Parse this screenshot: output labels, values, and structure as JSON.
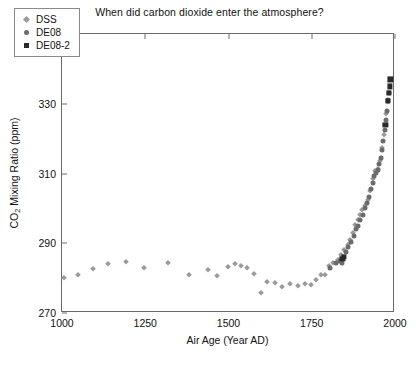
{
  "chart_data": {
    "type": "scatter",
    "title": "When did carbon dioxide enter the atmosphere?",
    "xlabel": "Air Age (Year AD)",
    "ylabel_html": "CO<sub>2</sub> Mixing Ratio (ppm)",
    "ylabel_text": "CO2 Mixing Ratio (ppm)",
    "xlim": [
      1000,
      2000
    ],
    "ylim": [
      270,
      350
    ],
    "xticks": [
      1000,
      1250,
      1500,
      1750,
      2000
    ],
    "yticks": [
      270,
      290,
      310,
      330,
      350
    ],
    "grid": false,
    "legend_position": "top-left",
    "colors": {
      "DSS": "#9a9a9a",
      "DE08": "#6b6b6b",
      "DE08-2": "#2a2a2a",
      "axis": "#6a6a6a",
      "text": "#111111",
      "background": "#ffffff"
    },
    "series": [
      {
        "name": "DSS",
        "marker": "diamond",
        "color": "#9a9a9a",
        "points": [
          [
            1006,
            280.0
          ],
          [
            1048,
            280.8
          ],
          [
            1092,
            282.5
          ],
          [
            1137,
            284.0
          ],
          [
            1191,
            284.6
          ],
          [
            1246,
            282.8
          ],
          [
            1317,
            284.2
          ],
          [
            1380,
            281.0
          ],
          [
            1437,
            282.4
          ],
          [
            1464,
            280.6
          ],
          [
            1497,
            283.2
          ],
          [
            1520,
            284.0
          ],
          [
            1538,
            283.6
          ],
          [
            1556,
            283.0
          ],
          [
            1578,
            281.2
          ],
          [
            1598,
            275.6
          ],
          [
            1616,
            279.0
          ],
          [
            1641,
            278.6
          ],
          [
            1662,
            277.4
          ],
          [
            1686,
            278.2
          ],
          [
            1710,
            277.6
          ],
          [
            1729,
            278.4
          ],
          [
            1748,
            278.0
          ],
          [
            1762,
            279.4
          ],
          [
            1777,
            280.8
          ],
          [
            1789,
            281.0
          ],
          [
            1802,
            283.6
          ],
          [
            1815,
            284.4
          ],
          [
            1828,
            285.2
          ],
          [
            1838,
            286.6
          ],
          [
            1848,
            288.0
          ],
          [
            1858,
            289.4
          ],
          [
            1866,
            291.0
          ],
          [
            1874,
            293.0
          ],
          [
            1881,
            295.2
          ],
          [
            1888,
            296.8
          ],
          [
            1895,
            298.0
          ],
          [
            1902,
            299.4
          ],
          [
            1910,
            300.6
          ],
          [
            1918,
            302.4
          ],
          [
            1926,
            305.0
          ],
          [
            1934,
            308.4
          ],
          [
            1941,
            310.6
          ],
          [
            1948,
            311.4
          ],
          [
            1955,
            313.6
          ],
          [
            1962,
            317.4
          ],
          [
            1968,
            321.0
          ],
          [
            1974,
            327.0
          ],
          [
            1978,
            330.6
          ]
        ]
      },
      {
        "name": "DE08",
        "marker": "circle",
        "color": "#6b6b6b",
        "points": [
          [
            1806,
            283.0
          ],
          [
            1822,
            284.2
          ],
          [
            1835,
            285.0
          ],
          [
            1841,
            284.2
          ],
          [
            1852,
            287.6
          ],
          [
            1860,
            288.8
          ],
          [
            1868,
            290.4
          ],
          [
            1876,
            292.0
          ],
          [
            1884,
            294.0
          ],
          [
            1890,
            295.0
          ],
          [
            1896,
            296.6
          ],
          [
            1903,
            298.2
          ],
          [
            1909,
            300.0
          ],
          [
            1915,
            301.6
          ],
          [
            1921,
            303.4
          ],
          [
            1927,
            305.6
          ],
          [
            1933,
            307.4
          ],
          [
            1938,
            309.2
          ],
          [
            1943,
            310.2
          ],
          [
            1948,
            311.0
          ],
          [
            1953,
            312.6
          ],
          [
            1957,
            314.4
          ],
          [
            1961,
            316.6
          ],
          [
            1965,
            319.4
          ],
          [
            1969,
            322.6
          ],
          [
            1972,
            325.4
          ],
          [
            1975,
            328.0
          ],
          [
            1978,
            331.0
          ],
          [
            1981,
            333.2
          ]
        ]
      },
      {
        "name": "DE08-2",
        "marker": "square",
        "color": "#2a2a2a",
        "points": [
          [
            1842,
            285.4
          ],
          [
            1846,
            286.2
          ],
          [
            1971,
            324.0
          ],
          [
            1978,
            330.8
          ],
          [
            1982,
            333.0
          ],
          [
            1984,
            335.0
          ],
          [
            1986,
            337.0
          ]
        ]
      }
    ]
  },
  "legend": {
    "items": [
      {
        "label": "DSS",
        "marker": "diamond",
        "color": "#9a9a9a"
      },
      {
        "label": "DE08",
        "marker": "circle",
        "color": "#6b6b6b"
      },
      {
        "label": "DE08-2",
        "marker": "square",
        "color": "#2a2a2a"
      }
    ]
  }
}
